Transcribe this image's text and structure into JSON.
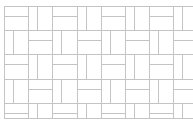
{
  "diagram": {
    "type": "basket-weave-tile-pattern",
    "background": "#ffffff",
    "line_color": "#c4c4c4",
    "line_width": 1,
    "origin": [
      4,
      6
    ],
    "block_size": 24.2,
    "columns": 8,
    "rows": 5,
    "visible_height": 118,
    "first_block_orientation": "horizontal",
    "orientations_note": "checkerboard: horizontal-split blocks alternate with vertical-split blocks",
    "vertical_split_offset": 9,
    "horizontal_split_offset": 10
  }
}
